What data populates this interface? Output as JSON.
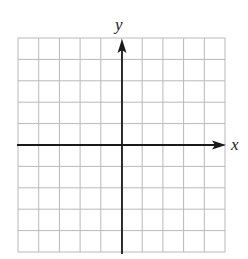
{
  "figure": {
    "type": "coordinate-grid",
    "grid": {
      "columns": 10,
      "rows": 10,
      "line_color": "#b9b9b9"
    },
    "axes": {
      "x_label": "x",
      "y_label": "y",
      "color": "#1a1a1a",
      "arrow_directions": [
        "positive-x",
        "positive-y"
      ]
    }
  }
}
